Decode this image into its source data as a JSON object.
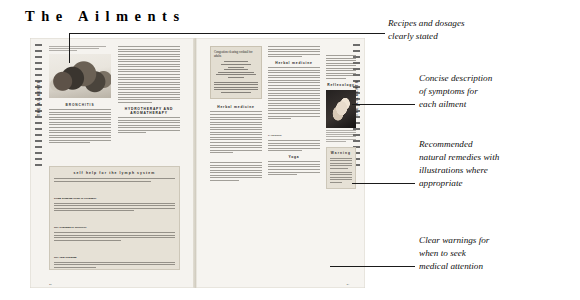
{
  "page_title": "The Ailments",
  "annotations": [
    {
      "id": "recipes",
      "lines": [
        "Recipes and dosages",
        "clearly stated"
      ]
    },
    {
      "id": "symptoms",
      "lines": [
        "Concise description",
        "of symptoms for",
        "each ailment"
      ]
    },
    {
      "id": "remedies",
      "lines": [
        "Recommended",
        "natural remedies with",
        "illustrations where",
        "appropriate"
      ]
    },
    {
      "id": "warnings",
      "lines": [
        "Clear warnings for",
        "when to seek",
        "medical attention"
      ]
    }
  ],
  "left_page": {
    "side_tab_label": "THE AILMENTS",
    "folio": "42",
    "photo_caption": "Lymphatic congestion has its causes in a sedentary lifestyle and poor diet",
    "section_kicker": "BRONCHITIS",
    "subheads": [
      "HYDROTHERAPY AND AROMATHERAPY"
    ],
    "self_help_panel": {
      "heading": "self help for the lymph system",
      "items": [
        "Using drinking tissue or bergamot",
        "Dry brushing or abrasives",
        "Dry skin brushing"
      ]
    }
  },
  "right_page": {
    "side_tab_label": "THE AILMENTS",
    "folio": "43",
    "recipe_box": {
      "heading": "Congestion clearing cocktail for adults",
      "ingredients": [
        "4 fl oz grape juice",
        "2 fl oz lemon juice",
        "1/4 clove",
        "1/2 cinnamon stick",
        "1 tsp elderflower cordial",
        "1 small squeeze of fresh ginger root",
        "1 tsp honey"
      ],
      "directions": "Simmer the ingredients for 10 minutes. Strain, add the liquor to a tumbler and sip, one mouthful at a time."
    },
    "subheads": [
      "Herbal medicine",
      "Herbal medicine",
      "Reflexology",
      "Yoga",
      "Nutritional and dietary therapy"
    ],
    "caution_runin": "CAUTION",
    "photo_caption": "The hand and reflex points for the lymphatic system",
    "warning_panel": {
      "heading": "Warning",
      "body": "Asthma, pleurisy, pneumonia, emphysema, and tuberculosis are potentially life-threatening conditions, and medical help should be sought immediately. The approaches described here are therefore in a supporting role only."
    }
  },
  "icons": {
    "side_tab": "vertical-tab-icon",
    "gutter": "book-gutter-icon"
  },
  "colors": {
    "paper": "#f3f1ec",
    "panel": "#e6e1d6",
    "ink": "#1a1a1a",
    "rule": "#6e6a64"
  }
}
